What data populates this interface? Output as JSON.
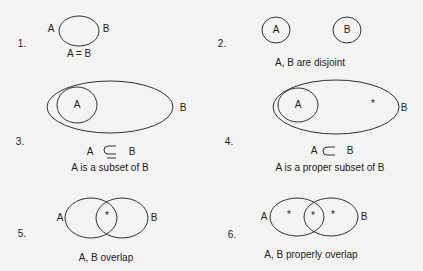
{
  "panels": [
    {
      "number": "1.",
      "set_a": "A",
      "set_b": "B",
      "relation": "A = B"
    },
    {
      "number": "2.",
      "set_a": "A",
      "set_b": "B",
      "caption": "A, B are disjoint"
    },
    {
      "number": "3.",
      "set_a": "A",
      "set_b": "B",
      "relation": "A ⊆ B",
      "caption": "A is a subset of B"
    },
    {
      "number": "4.",
      "set_a": "A",
      "set_b": "B",
      "relation": "A ⊂ B",
      "caption": "A is a proper subset of B",
      "marker": "*"
    },
    {
      "number": "5.",
      "set_a": "A",
      "set_b": "B",
      "caption": "A, B overlap",
      "marker": "*"
    },
    {
      "number": "6.",
      "set_a": "A",
      "set_b": "B",
      "caption": "A, B properly overlap",
      "marker": "*"
    }
  ],
  "colors": {
    "stroke": "#333333",
    "background": "#f4f4f2"
  }
}
